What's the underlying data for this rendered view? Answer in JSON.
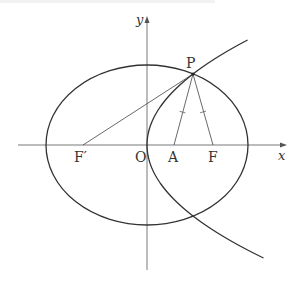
{
  "figure": {
    "type": "ellipse-parabola-geometry",
    "axes": {
      "x_label": "x",
      "y_label": "y",
      "origin_label": "O"
    },
    "points": {
      "P": {
        "label": "P"
      },
      "F": {
        "label": "F"
      },
      "F_prime": {
        "label": "F′"
      },
      "A": {
        "label": "A"
      },
      "O": {
        "label": "O"
      }
    },
    "curves": [
      {
        "name": "ellipse",
        "description": "ellipse centered at O with foci F′ and F"
      },
      {
        "name": "parabola",
        "description": "parabola with vertex O opening to the right, focus A"
      }
    ],
    "segments": [
      {
        "from": "F′",
        "to": "P"
      },
      {
        "from": "P",
        "to": "A",
        "mark": "tick"
      },
      {
        "from": "P",
        "to": "F",
        "mark": "tick"
      }
    ]
  },
  "colors": {
    "stroke": "#333333",
    "axis": "#555555",
    "background": "#ffffff"
  }
}
